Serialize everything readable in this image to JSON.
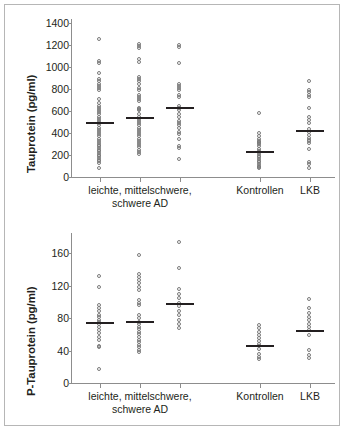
{
  "figure": {
    "border_color": "#b6b6b6",
    "point_color": "#7b7b7b",
    "median_color": "#231f20",
    "axis_color": "#8d8d8d"
  },
  "charts": {
    "top": {
      "ylabel": "Tauprotein (pg/ml)",
      "yticks": [
        "1400",
        "1200",
        "1000",
        "800",
        "600",
        "400",
        "200",
        "0"
      ],
      "group_label_1_line1": "leichte, mittelschwere,",
      "group_label_1_line2": "schwere AD",
      "group_label_2": "Kontrollen",
      "group_label_3": "LKB"
    },
    "bottom": {
      "ylabel": "P-Tauprotein (pg/ml)",
      "yticks": [
        "160",
        "120",
        "80",
        "40",
        "0"
      ],
      "group_label_1_line1": "leichte, mittelschwere,",
      "group_label_1_line2": "schwere AD",
      "group_label_2": "Kontrollen",
      "group_label_3": "LKB"
    }
  },
  "chart_data": [
    {
      "type": "scatter",
      "title": "Tauprotein",
      "ylabel": "Tauprotein (pg/ml)",
      "xlabel": "",
      "ylim": [
        0,
        1400
      ],
      "ytick_values": [
        0,
        200,
        400,
        600,
        800,
        1000,
        1200,
        1400
      ],
      "grid": false,
      "legend": "none",
      "xcategories": [
        "leichte AD",
        "mittelschwere AD",
        "schwere AD",
        "Kontrollen",
        "LKB"
      ],
      "xgroup_brackets": [
        {
          "label": "leichte, mittelschwere, schwere AD",
          "categories": [
            "leichte AD",
            "mittelschwere AD",
            "schwere AD"
          ]
        },
        {
          "label": "Kontrollen",
          "categories": [
            "Kontrollen"
          ]
        },
        {
          "label": "LKB",
          "categories": [
            "LKB"
          ]
        }
      ],
      "series": [
        {
          "name": "leichte AD",
          "median": 495,
          "values": [
            1250,
            1050,
            1030,
            940,
            880,
            860,
            840,
            820,
            800,
            780,
            700,
            660,
            640,
            620,
            600,
            580,
            560,
            540,
            520,
            500,
            480,
            460,
            440,
            420,
            400,
            380,
            360,
            340,
            320,
            300,
            285,
            270,
            255,
            240,
            225,
            210,
            195,
            180,
            165,
            150,
            135,
            120,
            70
          ]
        },
        {
          "name": "mittelschwere AD",
          "median": 540,
          "values": [
            1200,
            1180,
            1160,
            1060,
            1040,
            900,
            880,
            860,
            840,
            800,
            780,
            740,
            720,
            700,
            680,
            620,
            610,
            600,
            560,
            540,
            520,
            500,
            480,
            460,
            440,
            420,
            400,
            380,
            360,
            340,
            320,
            300,
            280,
            260,
            240,
            220,
            200
          ]
        },
        {
          "name": "schwere AD",
          "median": 628,
          "values": [
            1190,
            1170,
            1030,
            840,
            820,
            800,
            780,
            740,
            720,
            640,
            620,
            600,
            560,
            540,
            500,
            480,
            460,
            440,
            400,
            380,
            340,
            270,
            255,
            155
          ]
        },
        {
          "name": "Kontrollen",
          "median": 230,
          "values": [
            575,
            390,
            360,
            340,
            320,
            310,
            300,
            290,
            270,
            250,
            230,
            215,
            200,
            185,
            170,
            155,
            140,
            125,
            110,
            95,
            80,
            70
          ]
        },
        {
          "name": "LKB",
          "median": 420,
          "values": [
            860,
            780,
            760,
            740,
            720,
            615,
            540,
            510,
            480,
            430,
            400,
            370,
            345,
            330,
            320,
            300,
            250,
            130,
            110,
            75
          ]
        }
      ]
    },
    {
      "type": "scatter",
      "title": "P-Tauprotein",
      "ylabel": "P-Tauprotein (pg/ml)",
      "xlabel": "",
      "ylim": [
        0,
        180
      ],
      "ytick_values": [
        0,
        40,
        80,
        120,
        160
      ],
      "grid": false,
      "legend": "none",
      "xcategories": [
        "leichte AD",
        "mittelschwere AD",
        "schwere AD",
        "Kontrollen",
        "LKB"
      ],
      "xgroup_brackets": [
        {
          "label": "leichte, mittelschwere, schwere AD",
          "categories": [
            "leichte AD",
            "mittelschwere AD",
            "schwere AD"
          ]
        },
        {
          "label": "Kontrollen",
          "categories": [
            "Kontrollen"
          ]
        },
        {
          "label": "LKB",
          "categories": [
            "LKB"
          ]
        }
      ],
      "series": [
        {
          "name": "leichte AD",
          "median": 74,
          "values": [
            131,
            117,
            95,
            91,
            87,
            83,
            80,
            77,
            74,
            71,
            68,
            64,
            60,
            56,
            52,
            45,
            43,
            16
          ]
        },
        {
          "name": "mittelschwere AD",
          "median": 75,
          "values": [
            156,
            133,
            130,
            126,
            122,
            117,
            113,
            101,
            97,
            95,
            82,
            79,
            74,
            71,
            68,
            65,
            62,
            59,
            56,
            52,
            49,
            46,
            43,
            40,
            37
          ]
        },
        {
          "name": "schwere AD",
          "median": 98,
          "values": [
            172,
            140,
            115,
            108,
            103,
            98,
            94,
            88,
            82,
            76,
            72,
            67
          ]
        },
        {
          "name": "Kontrollen",
          "median": 46,
          "values": [
            70,
            66,
            62,
            58,
            54,
            50,
            47,
            44,
            41,
            34,
            31,
            28
          ]
        },
        {
          "name": "LKB",
          "median": 64,
          "values": [
            102,
            91,
            85,
            80,
            76,
            72,
            68,
            64,
            58,
            40,
            33,
            30
          ]
        }
      ]
    }
  ]
}
